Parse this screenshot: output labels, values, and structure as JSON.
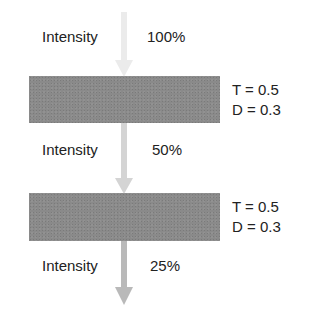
{
  "diagram": {
    "stages": [
      {
        "label": "Intensity",
        "value": "100%",
        "arrow_color": "#e8e8e8"
      },
      {
        "label": "Intensity",
        "value": "50%",
        "arrow_color": "#d2d2d2"
      },
      {
        "label": "Intensity",
        "value": "25%",
        "arrow_color": "#b8b8b8"
      }
    ],
    "filters": [
      {
        "t": "T = 0.5",
        "d": "D = 0.3",
        "color": "#8a8a8a"
      },
      {
        "t": "T = 0.5",
        "d": "D = 0.3",
        "color": "#8a8a8a"
      }
    ]
  }
}
